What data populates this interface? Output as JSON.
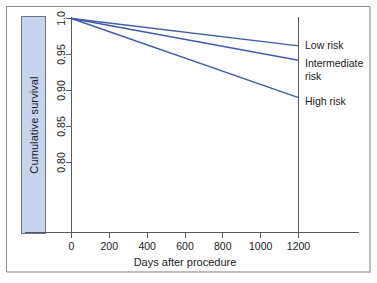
{
  "chart_data": {
    "type": "line",
    "title": "",
    "xlabel": "Days after procedure",
    "ylabel": "Cumulative survival",
    "xlim": [
      -120,
      1320
    ],
    "ylim": [
      0.775,
      1.005
    ],
    "xticks": [
      0,
      200,
      400,
      600,
      800,
      1000,
      1200
    ],
    "xtick_labels": [
      "0",
      "200",
      "400",
      "600",
      "800",
      "1000",
      "1200"
    ],
    "yticks": [
      0.8,
      0.85,
      0.9,
      0.95,
      1.0
    ],
    "ytick_labels": [
      "0.80",
      "0.85",
      "0.90",
      "0.95",
      "1.0"
    ],
    "grid": false,
    "legend_position": "right-inline",
    "reference_line_x": 1200,
    "series": [
      {
        "name": "Low risk",
        "color": "#3d5cab",
        "x": [
          0,
          1200
        ],
        "values": [
          1.0,
          0.962
        ]
      },
      {
        "name": "Intermediate risk",
        "color": "#3d5cab",
        "x": [
          0,
          1200
        ],
        "values": [
          1.0,
          0.942
        ]
      },
      {
        "name": "High risk",
        "color": "#3d5cab",
        "x": [
          0,
          1200
        ],
        "values": [
          1.0,
          0.89
        ]
      }
    ],
    "annotations": [
      {
        "text": "Low risk",
        "x": 1200,
        "y": 0.962
      },
      {
        "text": "Intermediate",
        "x": 1200,
        "y": 0.942
      },
      {
        "text": "risk",
        "x": 1200,
        "y": 0.92
      },
      {
        "text": "High risk",
        "x": 1200,
        "y": 0.89
      }
    ]
  },
  "axes": {
    "y_title": "Cumulative survival",
    "x_title": "Days after procedure",
    "x_tick_labels": [
      "0",
      "200",
      "400",
      "600",
      "800",
      "1000",
      "1200"
    ],
    "y_tick_labels": [
      "0.80",
      "0.85",
      "0.90",
      "0.95",
      "1.0"
    ]
  },
  "legend": {
    "low": "Low risk",
    "intermediate_line1": "Intermediate",
    "intermediate_line2": "risk",
    "high": "High risk"
  },
  "colors": {
    "curve": "#3d5cab",
    "axis": "#55595e",
    "highlight_fill": "#c6d5ee",
    "highlight_border": "#6b7480",
    "frame": "#8a8f94",
    "text": "#1a1a1a"
  }
}
